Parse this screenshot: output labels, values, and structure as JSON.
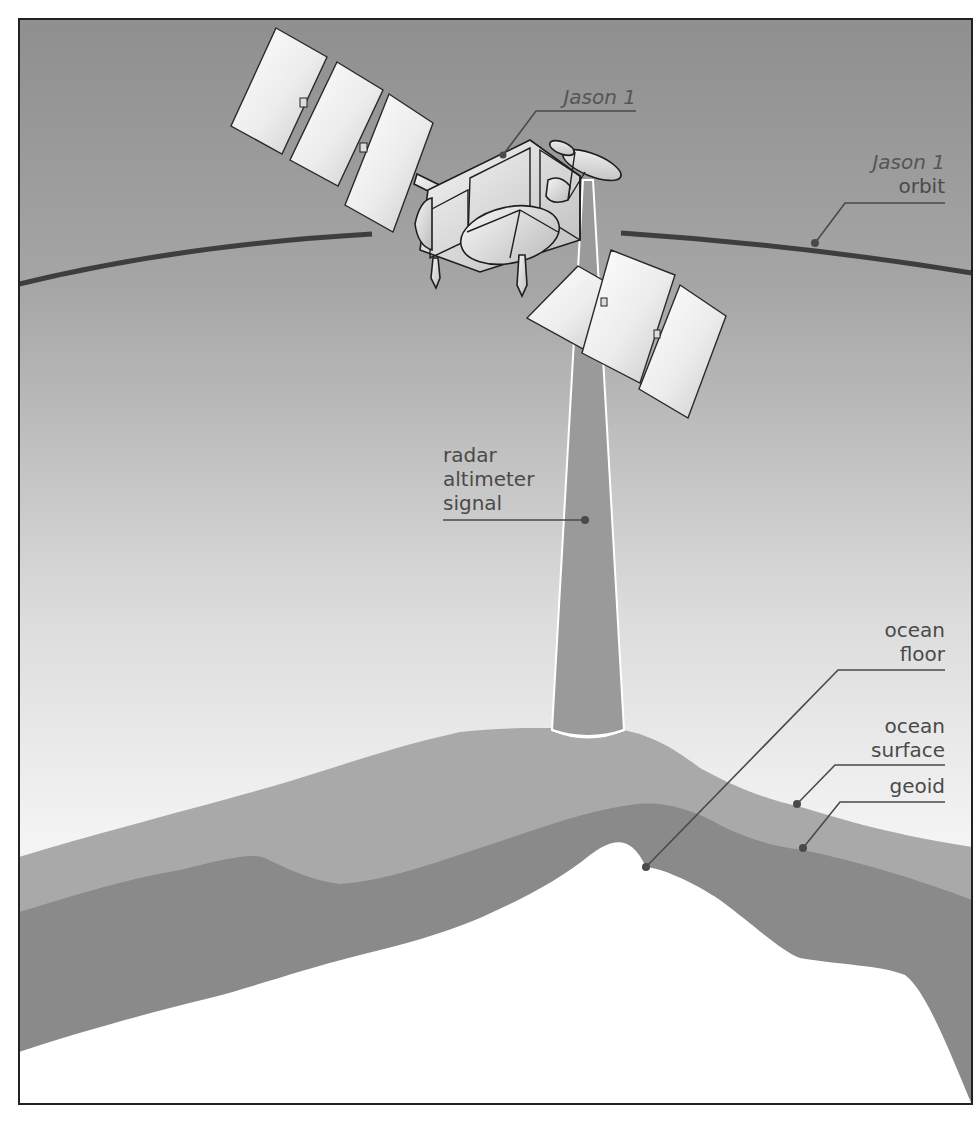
{
  "diagram": {
    "colors": {
      "sky_top": "#8f8f8f",
      "sky_bottom": "#f2f2f2",
      "ocean_band": "#a9a9a9",
      "geoid_band": "#8a8a8a",
      "ocean_floor": "#ffffff",
      "beam": "#9a9a9a",
      "orbit_line": "#3e3e3e",
      "frame": "#222222",
      "label_text": "#4a4a4a"
    },
    "labels": {
      "satellite": "Jason 1",
      "orbit_line1": "Jason 1",
      "orbit_line2": "orbit",
      "signal_line1": "radar",
      "signal_line2": "altimeter",
      "signal_line3": "signal",
      "floor_line1": "ocean",
      "floor_line2": "floor",
      "surface_line1": "ocean",
      "surface_line2": "surface",
      "geoid": "geoid"
    },
    "icons": {
      "satellite": "satellite-icon",
      "radar_beam": "radar-beam-icon"
    }
  }
}
